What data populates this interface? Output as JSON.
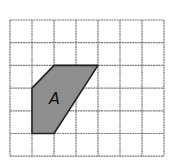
{
  "diagram": {
    "type": "grid-shape",
    "grid": {
      "columns": 7,
      "rows": 6,
      "origin_x": 10,
      "origin_y": 20,
      "cell_w": 22,
      "cell_h": 22.7,
      "line_color": "#7a7a7a"
    },
    "shape": {
      "label": "A",
      "fill": "#8f8f8f",
      "stroke": "#222222",
      "vertices_grid": [
        [
          1,
          3
        ],
        [
          2,
          2
        ],
        [
          4,
          2
        ],
        [
          2,
          5
        ],
        [
          1,
          5
        ]
      ]
    }
  }
}
